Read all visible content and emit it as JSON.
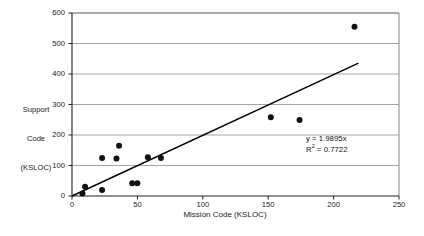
{
  "chart_data": {
    "type": "scatter",
    "title": "",
    "xlabel": "Mission Code (KSLOC)",
    "ylabel_lines": [
      "Support",
      "Code",
      "(KSLOC)"
    ],
    "ylabel": "Support Code (KSLOC)",
    "xlim": [
      0,
      250
    ],
    "ylim": [
      0,
      600
    ],
    "xticks": [
      0,
      50,
      100,
      150,
      200,
      250
    ],
    "yticks": [
      0,
      100,
      200,
      300,
      400,
      500,
      600
    ],
    "xtick_labels": [
      "0",
      "50",
      "100",
      "150",
      "200",
      "250"
    ],
    "ytick_labels": [
      "0",
      "100",
      "200",
      "300",
      "400",
      "500",
      "600"
    ],
    "grid": "horizontal",
    "grid_color": "#999999",
    "frame": true,
    "frame_color": "#7a7a7a",
    "legend": "none",
    "marker_color": "#111111",
    "marker_shape": "circle",
    "marker_size_px": 6,
    "points": [
      {
        "x": 8,
        "y": 8
      },
      {
        "x": 10,
        "y": 30
      },
      {
        "x": 23,
        "y": 20
      },
      {
        "x": 23,
        "y": 125
      },
      {
        "x": 34,
        "y": 123
      },
      {
        "x": 36,
        "y": 165
      },
      {
        "x": 46,
        "y": 42
      },
      {
        "x": 50,
        "y": 42
      },
      {
        "x": 58,
        "y": 127
      },
      {
        "x": 68,
        "y": 125
      },
      {
        "x": 152,
        "y": 258
      },
      {
        "x": 174,
        "y": 249
      },
      {
        "x": 216,
        "y": 555
      }
    ],
    "trendline": {
      "type": "linear-through-origin",
      "slope": 1.9895,
      "intercept": 0,
      "x_start": 0,
      "x_end": 219,
      "color": "#000000",
      "width_px": 1.4
    },
    "annotations": {
      "equation": "y = 1.9895x",
      "r_squared_prefix": "R",
      "r_squared_exponent": "2",
      "r_squared_value": " = 0.7722"
    }
  },
  "plot_geometry": {
    "left_px": 72,
    "right_px": 399,
    "top_px": 13,
    "bottom_px": 196
  }
}
